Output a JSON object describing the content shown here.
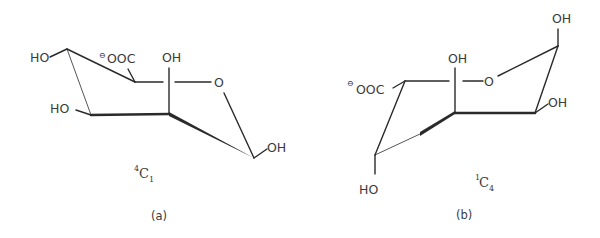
{
  "figure": {
    "structures": [
      {
        "id": "a",
        "caption": "(a)",
        "conformation": {
          "sup": "4",
          "base": "C",
          "sub": "1"
        },
        "labels": {
          "c4_substituent": "HO",
          "c3_substituent": "HO",
          "carboxylate": "OOC",
          "carboxylate_charge": "⊖",
          "c2_substituent": "OH",
          "ring_oxygen": "O",
          "c1_substituent": "OH"
        }
      },
      {
        "id": "b",
        "caption": "(b)",
        "conformation": {
          "sup": "1",
          "base": "C",
          "sub": "4"
        },
        "labels": {
          "carboxylate": "OOC",
          "carboxylate_charge": "⊖",
          "c4_substituent": "HO",
          "c2_substituent": "OH",
          "ring_oxygen": "O",
          "c1_substituent": "OH",
          "c3_substituent": "OH"
        }
      }
    ],
    "colors": {
      "ink": "#2a2a2a",
      "text": "#3a3a3a",
      "background": "#ffffff"
    }
  }
}
